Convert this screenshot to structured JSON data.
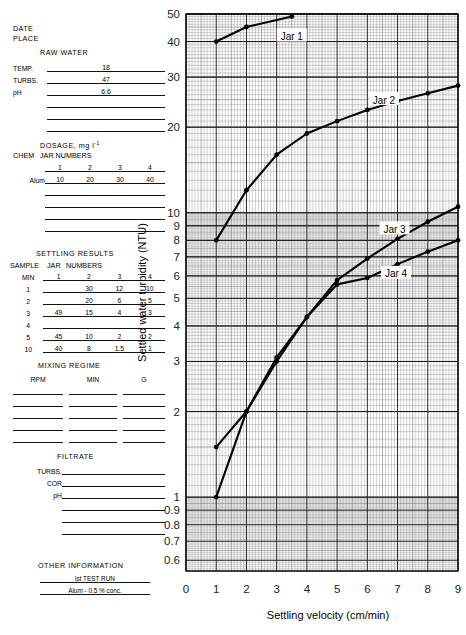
{
  "sheet": {
    "date_label": "DATE",
    "place_label": "PLACE",
    "raw_water": {
      "title": "RAW  WATER",
      "rows": [
        {
          "label": "TEMP.",
          "value": "18"
        },
        {
          "label": "TURBS.",
          "value": "47"
        },
        {
          "label": "pH",
          "value": "6.6"
        },
        {
          "label": "",
          "value": ""
        },
        {
          "label": "",
          "value": ""
        },
        {
          "label": "",
          "value": ""
        }
      ]
    },
    "dosage": {
      "title": "DOSAGE,  mg l",
      "title_sup": "-1",
      "chem_label": "CHEM",
      "jar_numbers_label": "JAR NUMBERS",
      "columns": [
        "1",
        "2",
        "3",
        "4"
      ],
      "rows": [
        {
          "chem": "Alum",
          "values": [
            "10",
            "20",
            "30",
            "40"
          ]
        },
        {
          "chem": "",
          "values": [
            "",
            "",
            "",
            ""
          ]
        },
        {
          "chem": "",
          "values": [
            "",
            "",
            "",
            ""
          ]
        },
        {
          "chem": "",
          "values": [
            "",
            "",
            "",
            ""
          ]
        },
        {
          "chem": "",
          "values": [
            "",
            "",
            "",
            ""
          ]
        }
      ]
    },
    "settling": {
      "title": "SETTLING   RESULTS",
      "sample_label": "SAMPLE",
      "jar_label": "JAR",
      "numbers_label": "NUMBERS",
      "min_label": "MIN",
      "columns": [
        "1",
        "2",
        "3",
        "4"
      ],
      "rows": [
        {
          "min": "1",
          "values": [
            "",
            "30",
            "12",
            "10"
          ]
        },
        {
          "min": "2",
          "values": [
            "",
            "20",
            "6",
            "5"
          ]
        },
        {
          "min": "3",
          "values": [
            "49",
            "15",
            "4",
            "3"
          ]
        },
        {
          "min": "4",
          "values": [
            "",
            "",
            "",
            ""
          ]
        },
        {
          "min": "5",
          "values": [
            "45",
            "10",
            "2",
            "2"
          ]
        },
        {
          "min": "10",
          "values": [
            "40",
            "8",
            "1.5",
            "1"
          ]
        }
      ]
    },
    "mixing": {
      "title": "MIXING   REGIME",
      "columns": [
        "RPM",
        "MIN",
        "G"
      ],
      "rows": [
        {
          "values": [
            "",
            "",
            ""
          ]
        },
        {
          "values": [
            "",
            "",
            ""
          ]
        },
        {
          "values": [
            "",
            "",
            ""
          ]
        },
        {
          "values": [
            "",
            "",
            ""
          ]
        },
        {
          "values": [
            "",
            "",
            ""
          ]
        }
      ]
    },
    "filtrate": {
      "title": "FILTRATE",
      "rows": [
        {
          "label": "TURBS.",
          "value": ""
        },
        {
          "label": "COR",
          "value": ""
        },
        {
          "label": "pH",
          "value": ""
        },
        {
          "label": "",
          "value": ""
        },
        {
          "label": "",
          "value": ""
        },
        {
          "label": "",
          "value": ""
        }
      ]
    },
    "other": {
      "title": "OTHER  INFORMATION",
      "lines": [
        "lst  TEST  RUN",
        "Alum - 0.5 %  conc."
      ]
    }
  },
  "chart_data": {
    "type": "line",
    "title": "",
    "xlabel": "Settling velocity  (cm/min)",
    "ylabel": "Settled water turbidity  (NTU)",
    "xscale": "linear",
    "yscale": "log",
    "xlim": [
      0,
      9
    ],
    "ylim": [
      0.55,
      50
    ],
    "xticks": [
      0,
      1,
      2,
      3,
      4,
      5,
      6,
      7,
      8,
      9
    ],
    "xtick_labels": [
      "0",
      "1",
      "2",
      "3",
      "4",
      "5",
      "6",
      "7",
      "8",
      "9"
    ],
    "yticks": [
      0.6,
      0.7,
      0.8,
      0.9,
      1,
      2,
      3,
      4,
      5,
      6,
      7,
      8,
      9,
      10,
      20,
      30,
      40,
      50
    ],
    "ytick_labels": [
      "0.6",
      "0.7",
      "0.8",
      "0.9",
      "1",
      "2",
      "3",
      "4",
      "5",
      "6",
      "7",
      "8",
      "9",
      "10",
      "20",
      "30",
      "40",
      "50"
    ],
    "grid": true,
    "grid_type": "log-log-paper",
    "legend_position": "inline-labels",
    "series": [
      {
        "name": "Jar 1",
        "label": "Jar 1",
        "label_x": 3.5,
        "label_y": 41,
        "x": [
          1,
          2,
          3.5
        ],
        "y": [
          40,
          45,
          49
        ],
        "markers": true
      },
      {
        "name": "Jar 2",
        "label": "Jar 2",
        "label_x": 6.55,
        "label_y": 24.5,
        "x": [
          1,
          2,
          3,
          4,
          5,
          6,
          7,
          8,
          9
        ],
        "y": [
          8,
          12,
          16,
          19,
          21,
          23,
          24.7,
          26.3,
          28
        ],
        "markers": true
      },
      {
        "name": "Jar 3",
        "label": "Jar 3",
        "label_x": 6.9,
        "label_y": 8.6,
        "x": [
          1,
          2,
          3,
          4,
          5,
          6,
          7,
          8,
          9
        ],
        "y": [
          1.5,
          2.0,
          3.0,
          4.3,
          5.8,
          6.9,
          8.1,
          9.3,
          10.5
        ],
        "markers": true
      },
      {
        "name": "Jar 4",
        "label": "Jar 4",
        "label_x": 6.95,
        "label_y": 6.0,
        "x": [
          1,
          2,
          3,
          4,
          5,
          6,
          7,
          8,
          9
        ],
        "y": [
          1.0,
          2.0,
          3.1,
          4.3,
          5.6,
          5.9,
          6.6,
          7.3,
          8.0
        ],
        "markers": true
      }
    ]
  }
}
